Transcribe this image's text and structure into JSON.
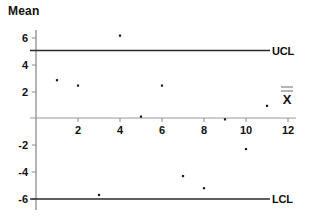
{
  "chart_data": {
    "type": "scatter",
    "title": "Mean",
    "xlabel": "",
    "ylabel": "",
    "xlim": [
      0,
      12
    ],
    "ylim": [
      -6.8,
      6.8
    ],
    "grid": false,
    "legend_position": "none",
    "x_ticks": [
      2,
      4,
      6,
      8,
      10,
      12
    ],
    "y_ticks": [
      6,
      4,
      2,
      -2,
      -4,
      -6
    ],
    "x": [
      1,
      2,
      3,
      4,
      5,
      6,
      7,
      8,
      9,
      10,
      11
    ],
    "values": [
      2.8,
      2.4,
      -5.7,
      6.1,
      0.1,
      2.4,
      -4.3,
      -5.2,
      -0.1,
      -2.3,
      0.9
    ],
    "series": [
      {
        "name": "Subgroup mean",
        "values": [
          2.8,
          2.4,
          -5.7,
          6.1,
          0.1,
          2.4,
          -4.3,
          -5.2,
          -0.1,
          -2.3,
          0.9
        ]
      }
    ],
    "annotations": [
      {
        "name": "ucl",
        "label": "UCL",
        "value": 5.0,
        "kind": "hline"
      },
      {
        "name": "lcl",
        "label": "LCL",
        "value": -6.0,
        "kind": "hline"
      },
      {
        "name": "center",
        "label": "X",
        "value": 0,
        "kind": "hline"
      }
    ]
  },
  "chart": {
    "title": "Mean",
    "ucl_label": "UCL",
    "lcl_label": "LCL",
    "center_label": "X",
    "x_tick_labels": [
      "2",
      "4",
      "6",
      "8",
      "10",
      "12"
    ],
    "y_tick_labels": [
      "6",
      "4",
      "2",
      "-2",
      "-4",
      "-6"
    ],
    "colors": {
      "limit_line": "#2b2b2b",
      "center_line": "#9a9a9a",
      "axis": "#6b6b6b",
      "point": "#1a1a1a",
      "text": "#111111",
      "background": "#ffffff"
    }
  }
}
